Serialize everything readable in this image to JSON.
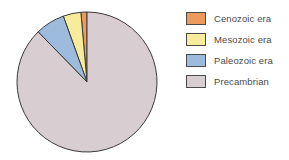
{
  "chart_data": {
    "type": "pie",
    "title": "",
    "categories": [
      "Cenozoic era",
      "Mesozoic era",
      "Paleozoic era",
      "Precambrian"
    ],
    "values": [
      1.4,
      4.1,
      6.8,
      87.7
    ],
    "unit": "percent of geologic time",
    "colors": [
      "#ec9a5e",
      "#f6ec9c",
      "#9dbbdd",
      "#d8cdd1"
    ],
    "start_angle_deg": 90,
    "direction": "counterclockwise",
    "legend_position": "right",
    "grid": false,
    "slice_border_color": "#3a3a38",
    "slices": [
      {
        "label": "Cenozoic era",
        "value": 1.4,
        "color": "#ec9a5e"
      },
      {
        "label": "Mesozoic era",
        "value": 4.1,
        "color": "#f6ec9c"
      },
      {
        "label": "Paleozoic era",
        "value": 6.8,
        "color": "#9dbbdd"
      },
      {
        "label": "Precambrian",
        "value": 87.7,
        "color": "#d8cdd1"
      }
    ]
  },
  "legend": {
    "items": [
      {
        "label": "Cenozoic era",
        "color": "#ec9a5e"
      },
      {
        "label": "Mesozoic era",
        "color": "#f6ec9c"
      },
      {
        "label": "Paleozoic era",
        "color": "#9dbbdd"
      },
      {
        "label": "Precambrian",
        "color": "#d8cdd1"
      }
    ]
  },
  "pie_geometry": {
    "cx": 87,
    "cy": 82,
    "r": 70
  }
}
